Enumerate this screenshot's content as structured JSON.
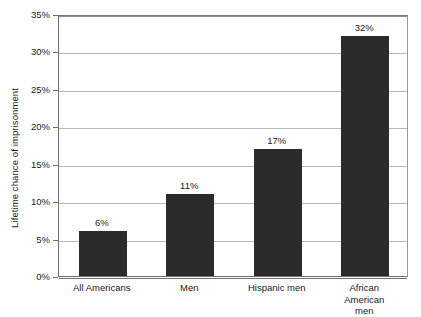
{
  "chart_data": {
    "type": "bar",
    "title": "",
    "xlabel": "",
    "ylabel": "Lifetime chance of imprisonment",
    "categories": [
      "All Americans",
      "Men",
      "Hispanic men",
      "African American\nmen"
    ],
    "values": [
      6,
      11,
      17,
      32
    ],
    "value_labels": [
      "6%",
      "11%",
      "17%",
      "32%"
    ],
    "ylim": [
      0,
      35
    ],
    "ytick_labels": [
      "0%",
      "5%",
      "10%",
      "15%",
      "20%",
      "25%",
      "30%",
      "35%"
    ],
    "ytick_values": [
      0,
      5,
      10,
      15,
      20,
      25,
      30,
      35
    ],
    "grid": true,
    "legend": "none",
    "bar_color": "#2b2b2b",
    "gridline_color": "#b9b9b9",
    "axis_color": "#6f6f6f",
    "background_color": "#ffffff"
  }
}
